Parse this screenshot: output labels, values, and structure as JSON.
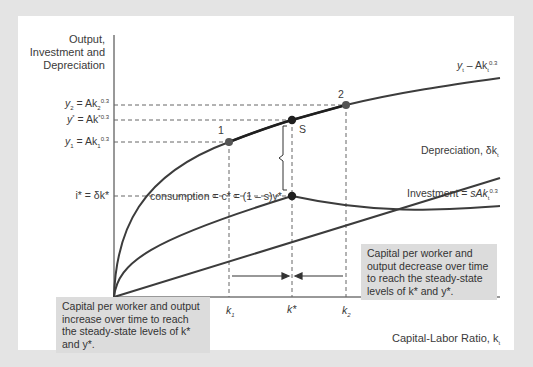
{
  "figure": {
    "y_axis_title_lines": [
      "Output,",
      "Investment and",
      "Depreciation"
    ],
    "x_axis_title": "Capital-Labor Ratio, k",
    "x_axis_title_sub": "t",
    "y_labels": {
      "y2": {
        "lhs": "y",
        "lhs_sub": "2",
        "eq": " = Ak",
        "sub": "2",
        "sup": "0.3"
      },
      "ystar": {
        "lhs": "y",
        "lhs_sup": "*",
        "eq": " = Ak",
        "sup": "*0.3"
      },
      "y1": {
        "lhs": "y",
        "lhs_sub": "1",
        "eq": " = Ak",
        "sub": "1",
        "sup": "0.3"
      },
      "istar": {
        "text": "i* = δk*"
      }
    },
    "x_labels": {
      "k1": {
        "main": "k",
        "sub": "1"
      },
      "kstar": {
        "main": "k*"
      },
      "k2": {
        "main": "k",
        "sub": "2"
      }
    },
    "curve_labels": {
      "output": {
        "pre": "y",
        "sub": "t",
        "mid": " – Ak",
        "sub2": "t",
        "sup": "0.3"
      },
      "depreciation": {
        "pre": "Depreciation, δk",
        "sub": "t"
      },
      "investment": {
        "pre": "Investment = ",
        "it": "sAk",
        "sub": "t",
        "sup": "0.3"
      }
    },
    "points": {
      "p1": "1",
      "p2": "2",
      "s": "S"
    },
    "consumption_label": "consumption = c* = (1 – s)y*",
    "notes": {
      "left": "Capital per worker and output increase over time to reach the steady-state levels of k* and y*.",
      "right": "Capital per worker and output decrease over time to reach the steady-state levels of k* and y*."
    },
    "colors": {
      "curve": "#3c3c3c",
      "point": "#2a2a2a",
      "note_bg": "#dcdcdc",
      "frame": "#e4e4e4"
    }
  }
}
